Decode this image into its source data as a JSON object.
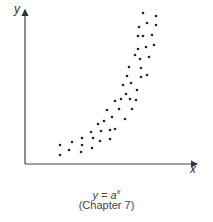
{
  "chart_data": {
    "type": "scatter",
    "title": "",
    "xlabel": "x",
    "ylabel": "y",
    "grid": false,
    "legend": null,
    "caption_formula": "y = a",
    "caption_exponent": "x",
    "caption_chapter": "(Chapter 7)",
    "annotation": "Exponential trend scatter, y = a^x",
    "points_px": [
      [
        143,
        13
      ],
      [
        156,
        16
      ],
      [
        147,
        23
      ],
      [
        156,
        25
      ],
      [
        139,
        27
      ],
      [
        138,
        36
      ],
      [
        143,
        36
      ],
      [
        152,
        35
      ],
      [
        154,
        45
      ],
      [
        146,
        47
      ],
      [
        138,
        49
      ],
      [
        135,
        55
      ],
      [
        140,
        59
      ],
      [
        149,
        57
      ],
      [
        129,
        67
      ],
      [
        141,
        68
      ],
      [
        127,
        76
      ],
      [
        141,
        77
      ],
      [
        147,
        75
      ],
      [
        131,
        83
      ],
      [
        123,
        85
      ],
      [
        137,
        90
      ],
      [
        126,
        94
      ],
      [
        121,
        99
      ],
      [
        130,
        99
      ],
      [
        136,
        100
      ],
      [
        115,
        101
      ],
      [
        107,
        110
      ],
      [
        119,
        109
      ],
      [
        132,
        109
      ],
      [
        112,
        117
      ],
      [
        125,
        119
      ],
      [
        104,
        121
      ],
      [
        98,
        124
      ],
      [
        91,
        132
      ],
      [
        101,
        131
      ],
      [
        110,
        130
      ],
      [
        115,
        129
      ],
      [
        82,
        138
      ],
      [
        93,
        138
      ],
      [
        72,
        142
      ],
      [
        60,
        145
      ],
      [
        82,
        145
      ],
      [
        100,
        141
      ],
      [
        110,
        139
      ],
      [
        92,
        148
      ],
      [
        69,
        150
      ],
      [
        81,
        152
      ],
      [
        60,
        155
      ]
    ]
  },
  "axes": {
    "x_label": "x",
    "y_label": "y"
  }
}
